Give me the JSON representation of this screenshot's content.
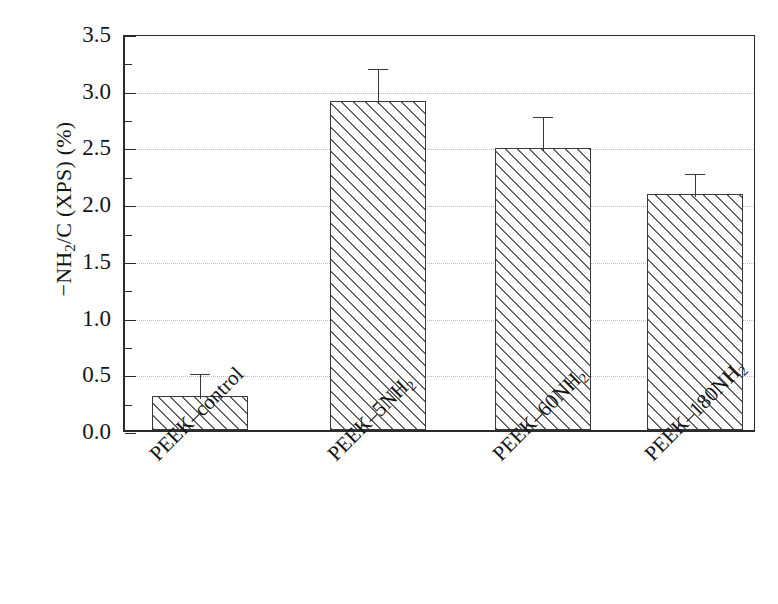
{
  "chart_data": {
    "type": "bar",
    "title": "",
    "subtitle": "",
    "xlabel": "",
    "ylabel": "−NH2/C (XPS) (%)",
    "ylabel_parts": {
      "prefix": "−NH",
      "sub": "2",
      "suffix": "/C (XPS) (%)"
    },
    "categories": [
      "PEEK–control",
      "PEEK–5NH2",
      "PEEK–60NH2",
      "PEEK–180NH2"
    ],
    "category_parts": [
      {
        "base": "PEEK–control",
        "sub": ""
      },
      {
        "base": "PEEK–5NH",
        "sub": "2"
      },
      {
        "base": "PEEK–60NH",
        "sub": "2"
      },
      {
        "base": "PEEK–180NH",
        "sub": "2"
      }
    ],
    "values": [
      0.3,
      2.9,
      2.49,
      2.08
    ],
    "errors": [
      0.22,
      0.31,
      0.3,
      0.2
    ],
    "error_upper": [
      0.52,
      3.21,
      2.79,
      2.28
    ],
    "ylim": [
      0.0,
      3.5
    ],
    "ytick_labels": [
      "0.0",
      "0.5",
      "1.0",
      "1.5",
      "2.0",
      "2.5",
      "3.0",
      "3.5"
    ],
    "ytick_values": [
      0.0,
      0.5,
      1.0,
      1.5,
      2.0,
      2.5,
      3.0,
      3.5
    ],
    "yminor_values": [
      0.25,
      0.75,
      1.25,
      1.75,
      2.25,
      2.75,
      3.25
    ],
    "grid": true,
    "grid_axis": "y",
    "grid_style": "dotted",
    "legend": "none",
    "bar_fill": "hatched-diagonal",
    "bar_edge_color": "#3a3a3a",
    "grid_color": "#b9b9b9",
    "axis_color": "#2b2b2b",
    "xlabel_rotation": -45
  }
}
